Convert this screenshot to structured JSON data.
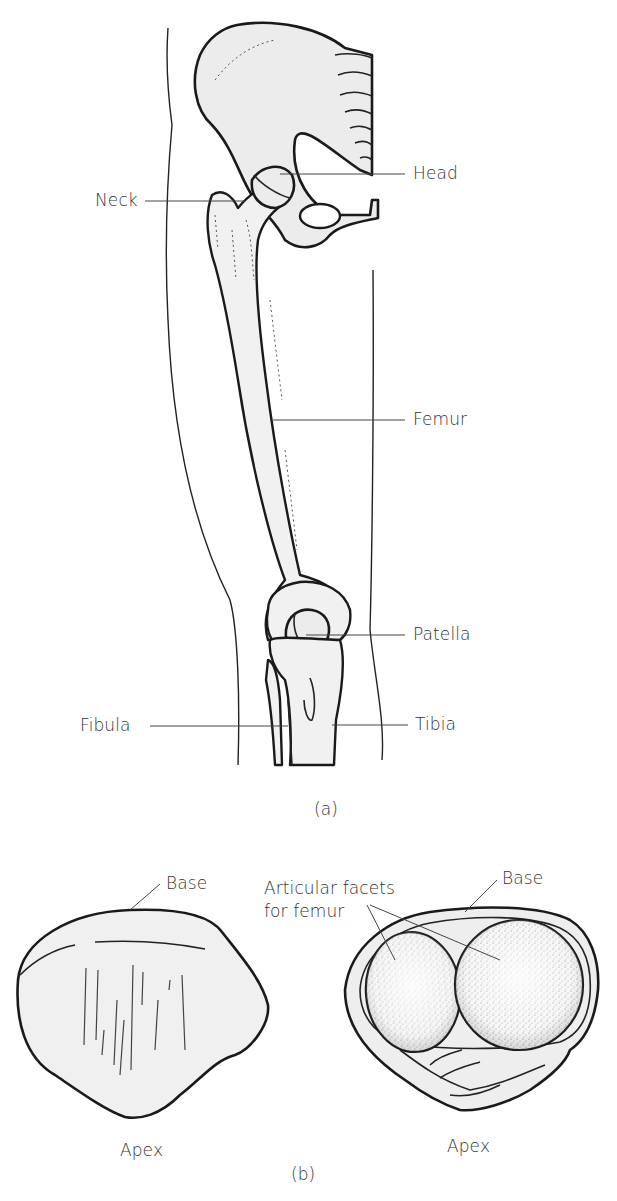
{
  "figure_a": {
    "panel_label": "(a)",
    "labels": {
      "head": "Head",
      "neck": "Neck",
      "femur": "Femur",
      "patella": "Patella",
      "fibula": "Fibula",
      "tibia": "Tibia"
    }
  },
  "figure_b": {
    "panel_label": "(b)",
    "anterior_view": {
      "base": "Base",
      "apex": "Apex"
    },
    "posterior_view": {
      "facets_line1": "Articular facets",
      "facets_line2": "for femur",
      "base": "Base",
      "apex": "Apex"
    }
  },
  "colors": {
    "bone_fill": "#ececec",
    "outline": "#1a1a1a",
    "text": "#333333",
    "facet_stipple": "#555555"
  }
}
